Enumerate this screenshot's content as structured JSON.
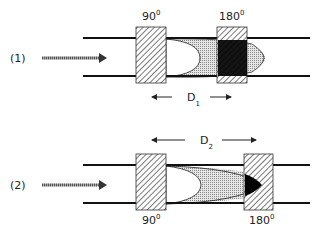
{
  "diagram": {
    "panels": [
      {
        "id": "1",
        "label": "(1)",
        "left_coil_angle": "90",
        "right_coil_angle": "180",
        "degree_symbol": "0",
        "distance_label": "D",
        "distance_subscript": "1",
        "angle_label_position": "above"
      },
      {
        "id": "2",
        "label": "(2)",
        "left_coil_angle": "90",
        "right_coil_angle": "180",
        "degree_symbol": "0",
        "distance_label": "D",
        "distance_subscript": "2",
        "angle_label_position": "below"
      }
    ],
    "colors": {
      "lines": "#111111",
      "hatch": "#333333",
      "stipple": "#bdbdbd",
      "black_fill": "#000000",
      "background": "#ffffff"
    }
  }
}
